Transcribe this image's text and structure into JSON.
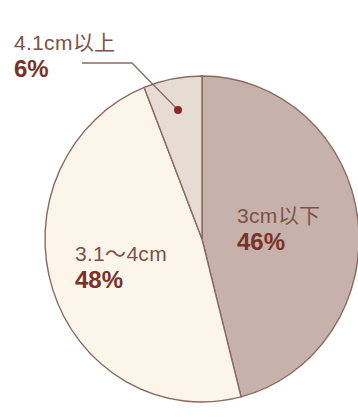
{
  "chart_data": {
    "type": "pie",
    "title": "",
    "categories": [
      "3cm以下",
      "3.1〜4cm",
      "4.1cm以上"
    ],
    "values": [
      46,
      48,
      6
    ],
    "unit": "%",
    "colors": [
      "#c6b2aa",
      "#fbf5ea",
      "#e6dcd4"
    ],
    "legend": "none (direct labels)",
    "labels": [
      {
        "name": "3cm以下",
        "pct": "46%"
      },
      {
        "name": "3.1〜4cm",
        "pct": "48%"
      },
      {
        "name": "4.1cm以上",
        "pct": "6%"
      }
    ],
    "start_angle_deg": 0,
    "direction": "clockwise from 12 o'clock"
  },
  "style": {
    "outline": "#8a6a60",
    "label_text": "#7d5248",
    "pct_text": "#7a3228",
    "dot": "#8a2a22"
  }
}
